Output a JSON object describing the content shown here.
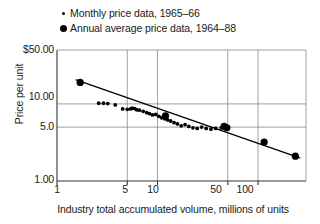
{
  "legend": {
    "items": [
      {
        "marker": "small-dot",
        "label": "Monthly price data, 1965–66"
      },
      {
        "marker": "large-dot",
        "label": "Annual average price data, 1964–88"
      }
    ]
  },
  "chart_data": {
    "type": "scatter",
    "title": "",
    "xlabel": "Industry total accumulated volume, millions of units",
    "ylabel": "Price per unit",
    "xscale": "log",
    "yscale": "log",
    "xlim": [
      1,
      300
    ],
    "ylim": [
      1,
      50
    ],
    "grid": true,
    "legend_position": "above-plot-left",
    "xticks": [
      "1",
      "5",
      "10",
      "50",
      "100"
    ],
    "xtick_values": [
      1,
      5,
      10,
      50,
      100
    ],
    "yticks": [
      "$50.00",
      "10.00",
      "5.0",
      "1.00"
    ],
    "ytick_values": [
      50,
      10,
      5,
      1
    ],
    "colors": {
      "marker": "#000000",
      "trendline": "#000000",
      "grid": "#888888",
      "axis": "#333333"
    },
    "series": [
      {
        "name": "Monthly price data, 1965–66",
        "marker": "small-dot",
        "points": [
          [
            2.6,
            10.2
          ],
          [
            2.9,
            10.2
          ],
          [
            3.2,
            10.1
          ],
          [
            3.8,
            9.7
          ],
          [
            4.5,
            8.6
          ],
          [
            5.0,
            8.5
          ],
          [
            5.4,
            8.6
          ],
          [
            5.6,
            8.8
          ],
          [
            5.9,
            8.7
          ],
          [
            6.2,
            8.4
          ],
          [
            6.6,
            8.3
          ],
          [
            7.2,
            8.0
          ],
          [
            7.8,
            7.7
          ],
          [
            8.3,
            7.5
          ],
          [
            8.9,
            7.2
          ],
          [
            9.6,
            7.3
          ],
          [
            10.3,
            6.9
          ],
          [
            11.0,
            6.6
          ],
          [
            11.8,
            6.4
          ],
          [
            12.6,
            6.2
          ],
          [
            13.5,
            6.0
          ],
          [
            14.6,
            5.7
          ],
          [
            15.8,
            5.5
          ],
          [
            17.2,
            5.2
          ],
          [
            18.8,
            5.4
          ],
          [
            20.5,
            5.1
          ],
          [
            22.5,
            4.9
          ],
          [
            24.8,
            4.8
          ],
          [
            27.5,
            5.0
          ],
          [
            30.5,
            4.8
          ],
          [
            34.0,
            4.7
          ],
          [
            38.0,
            4.8
          ],
          [
            43.0,
            4.9
          ],
          [
            48.0,
            5.0
          ]
        ]
      },
      {
        "name": "Annual average price data, 1964–88",
        "marker": "large-dot",
        "points": [
          [
            1.7,
            19.0
          ],
          [
            12.0,
            7.0
          ],
          [
            46.0,
            5.1
          ],
          [
            49.0,
            4.9
          ],
          [
            115.0,
            3.2
          ],
          [
            235.0,
            2.1
          ]
        ]
      }
    ],
    "trendline": {
      "name": "experience curve fit",
      "from": [
        1.55,
        20.5
      ],
      "to": [
        260.0,
        2.0
      ]
    }
  }
}
